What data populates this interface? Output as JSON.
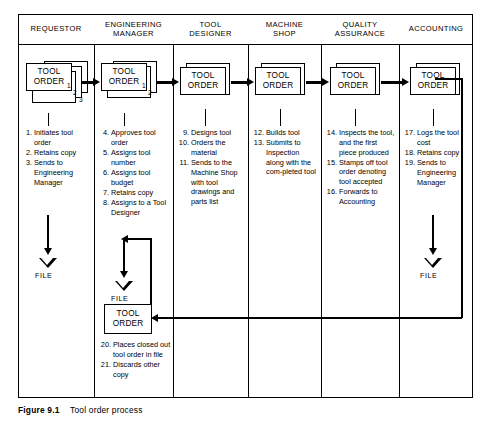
{
  "diagram": {
    "caption_label": "Figure 9.1",
    "caption_text": "Tool order process",
    "columns": [
      {
        "id": "requestor",
        "header": [
          "REQUESTOR"
        ]
      },
      {
        "id": "engineering-manager",
        "header": [
          "ENGINEERING",
          "MANAGER"
        ]
      },
      {
        "id": "tool-designer",
        "header": [
          "TOOL",
          "DESIGNER"
        ]
      },
      {
        "id": "machine-shop",
        "header": [
          "MACHINE",
          "SHOP"
        ]
      },
      {
        "id": "quality-assurance",
        "header": [
          "QUALITY",
          "ASSURANCE"
        ]
      },
      {
        "id": "accounting",
        "header": [
          "ACCOUNTING"
        ]
      }
    ],
    "document_label": {
      "line1": "TOOL",
      "line2": "ORDER"
    },
    "file_label": "FILE",
    "copy_numbers": {
      "requestor": [
        "1",
        "2",
        "3"
      ],
      "engineering_manager": [
        "1",
        "2"
      ]
    },
    "steps": {
      "requestor": [
        {
          "n": "1.",
          "text": "Initiates tool order"
        },
        {
          "n": "2.",
          "text": "Retains copy"
        },
        {
          "n": "3.",
          "text": "Sends to Engineering Manager"
        }
      ],
      "engineering_manager": [
        {
          "n": "4.",
          "text": "Approves tool order"
        },
        {
          "n": "5.",
          "text": "Assigns tool number"
        },
        {
          "n": "6.",
          "text": "Assigns tool budget"
        },
        {
          "n": "7.",
          "text": "Retains copy"
        },
        {
          "n": "8.",
          "text": "Assigns to a Tool Designer"
        }
      ],
      "tool_designer": [
        {
          "n": "9.",
          "text": "Designs tool"
        },
        {
          "n": "10.",
          "text": "Orders the material"
        },
        {
          "n": "11.",
          "text": "Sends to the Machine Shop with tool drawings and parts list"
        }
      ],
      "machine_shop": [
        {
          "n": "12.",
          "text": "Builds tool"
        },
        {
          "n": "13.",
          "text": "Submits to Inspection along with the com-pleted  tool"
        }
      ],
      "quality_assurance": [
        {
          "n": "14.",
          "text": "Inspects the tool, and the first piece produced"
        },
        {
          "n": "15.",
          "text": "Stamps off tool order denoting tool accepted"
        },
        {
          "n": "16.",
          "text": "Forwards to Accounting"
        }
      ],
      "accounting": [
        {
          "n": "17.",
          "text": "Logs the tool cost"
        },
        {
          "n": "18.",
          "text": "Retains copy"
        },
        {
          "n": "19.",
          "text": "Sends to Engineering Manager"
        }
      ],
      "engineering_manager_closeout": [
        {
          "n": "20.",
          "text": "Places closed out tool order in file"
        },
        {
          "n": "21.",
          "text": "Discards other copy"
        }
      ]
    }
  }
}
